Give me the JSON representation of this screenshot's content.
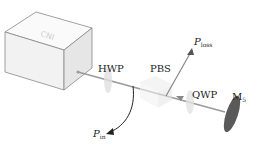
{
  "diagram": {
    "components": {
      "laser": {
        "name": "laser source box"
      },
      "hwp": {
        "label": "HWP"
      },
      "pbs": {
        "label": "PBS"
      },
      "qwp": {
        "label": "QWP"
      },
      "mirror": {
        "label_main": "M",
        "label_sub": "5"
      }
    },
    "signals": {
      "p_loss": {
        "label_main": "P",
        "label_sub": "loss"
      },
      "p_in": {
        "label_main": "P",
        "label_sub": "in"
      }
    },
    "colors": {
      "box_face": "#f4f4f4",
      "box_edge": "#777777",
      "beam": "#9a9a9a",
      "mirror": "#5a5a5a",
      "arrow": "#222222"
    }
  }
}
